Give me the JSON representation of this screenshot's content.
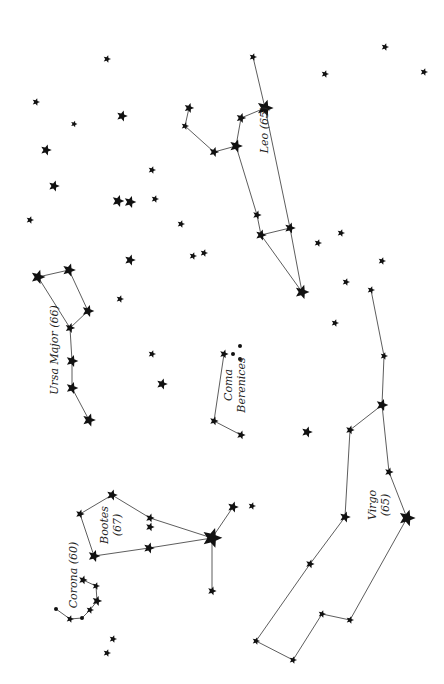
{
  "colors": {
    "background": "#ffffff",
    "ink": "#111111",
    "line": "#333333"
  },
  "constellations": [
    {
      "name": "Leo",
      "label": "Leo (65)",
      "label_pos": [
        268,
        130
      ],
      "label_rotate": -90,
      "stars": [
        [
          253,
          57,
          3.5
        ],
        [
          265,
          108,
          7.5
        ],
        [
          241,
          118,
          4.5
        ],
        [
          189,
          108,
          4.5
        ],
        [
          185,
          126,
          3.5
        ],
        [
          214,
          152,
          4.5
        ],
        [
          236,
          146,
          6
        ],
        [
          257,
          215,
          4
        ],
        [
          261,
          235,
          5
        ],
        [
          290,
          228,
          5
        ],
        [
          302,
          292,
          6.5
        ]
      ],
      "lines": [
        [
          0,
          1
        ],
        [
          1,
          2
        ],
        [
          2,
          6
        ],
        [
          3,
          4
        ],
        [
          4,
          5
        ],
        [
          5,
          6
        ],
        [
          6,
          7
        ],
        [
          7,
          8
        ],
        [
          8,
          9
        ],
        [
          1,
          9
        ],
        [
          9,
          10
        ],
        [
          8,
          10
        ]
      ]
    },
    {
      "name": "Ursa Major",
      "label": "Ursa Major (66)",
      "label_pos": [
        58,
        350
      ],
      "label_rotate": -90,
      "stars": [
        [
          38,
          277,
          6.5
        ],
        [
          69,
          270,
          6
        ],
        [
          88,
          311,
          5.5
        ],
        [
          70,
          328,
          4.5
        ],
        [
          72,
          361,
          5.5
        ],
        [
          72,
          388,
          5.5
        ],
        [
          89,
          420,
          6
        ]
      ],
      "lines": [
        [
          0,
          1
        ],
        [
          1,
          2
        ],
        [
          2,
          3
        ],
        [
          0,
          3
        ],
        [
          3,
          4
        ],
        [
          4,
          5
        ],
        [
          5,
          6
        ]
      ]
    },
    {
      "name": "Coma Berenices",
      "label": "Coma",
      "label2": "Berenices",
      "label_pos": [
        232,
        385
      ],
      "label_rotate": -90,
      "stars": [
        [
          224,
          354,
          4
        ],
        [
          214,
          421,
          4
        ],
        [
          241,
          435,
          4
        ]
      ],
      "dots": [
        [
          233,
          354,
          2
        ],
        [
          240,
          346,
          2
        ],
        [
          240,
          359,
          2
        ]
      ],
      "lines": [
        [
          0,
          1
        ],
        [
          1,
          2
        ]
      ]
    },
    {
      "name": "Virgo",
      "label": "Virgo",
      "label2": "(65)",
      "label_pos": [
        376,
        505
      ],
      "label_rotate": -90,
      "stars": [
        [
          371,
          290,
          3.5
        ],
        [
          384,
          356,
          3.5
        ],
        [
          382,
          405,
          5.5
        ],
        [
          350,
          430,
          4
        ],
        [
          389,
          472,
          4
        ],
        [
          407,
          518,
          7.5
        ],
        [
          345,
          517,
          5
        ],
        [
          310,
          564,
          4
        ],
        [
          256,
          641,
          3.5
        ],
        [
          293,
          660,
          3.5
        ],
        [
          322,
          614,
          3.5
        ],
        [
          350,
          620,
          3.5
        ]
      ],
      "lines": [
        [
          0,
          1
        ],
        [
          1,
          2
        ],
        [
          2,
          3
        ],
        [
          2,
          4
        ],
        [
          4,
          5
        ],
        [
          3,
          6
        ],
        [
          6,
          7
        ],
        [
          7,
          8
        ],
        [
          8,
          9
        ],
        [
          9,
          10
        ],
        [
          10,
          11
        ],
        [
          11,
          5
        ]
      ]
    },
    {
      "name": "Bootes",
      "label": "Bootes",
      "label2": "(67)",
      "label_pos": [
        108,
        525
      ],
      "label_rotate": -90,
      "stars": [
        [
          112,
          495,
          5
        ],
        [
          80,
          514,
          4
        ],
        [
          150,
          518,
          4
        ],
        [
          150,
          527,
          4
        ],
        [
          212,
          538,
          9
        ],
        [
          149,
          548,
          5
        ],
        [
          94,
          556,
          5.5
        ],
        [
          233,
          507,
          5
        ],
        [
          212,
          591,
          4
        ]
      ],
      "lines": [
        [
          0,
          1
        ],
        [
          1,
          6
        ],
        [
          6,
          5
        ],
        [
          5,
          4
        ],
        [
          0,
          2
        ],
        [
          2,
          4
        ],
        [
          4,
          7
        ],
        [
          4,
          8
        ]
      ]
    },
    {
      "name": "Corona",
      "label": "Corona (60)",
      "label_pos": [
        77,
        575
      ],
      "label_rotate": -90,
      "stars": [
        [
          83,
          580,
          4
        ],
        [
          96,
          586,
          3.5
        ],
        [
          97,
          601,
          4.5
        ],
        [
          90,
          610,
          3.5
        ],
        [
          70,
          619,
          3.5
        ]
      ],
      "dots": [
        [
          56,
          609,
          2
        ],
        [
          82,
          618,
          2
        ]
      ],
      "path": [
        [
          56,
          609
        ],
        [
          70,
          619
        ],
        [
          82,
          618
        ],
        [
          90,
          610
        ],
        [
          97,
          601
        ],
        [
          96,
          586
        ],
        [
          83,
          580
        ]
      ]
    }
  ],
  "field_stars": [
    [
      107,
      59,
      3.5
    ],
    [
      36,
      102,
      3.5
    ],
    [
      74,
      124,
      3
    ],
    [
      122,
      116,
      5
    ],
    [
      46,
      150,
      5
    ],
    [
      54,
      186,
      5
    ],
    [
      30,
      220,
      3.5
    ],
    [
      118,
      201,
      5.5
    ],
    [
      130,
      202,
      5.5
    ],
    [
      155,
      199,
      3.5
    ],
    [
      152,
      170,
      3.5
    ],
    [
      181,
      224,
      3.5
    ],
    [
      193,
      256,
      3.5
    ],
    [
      204,
      253,
      3.5
    ],
    [
      130,
      260,
      5
    ],
    [
      120,
      299,
      3.5
    ],
    [
      152,
      354,
      3.5
    ],
    [
      162,
      384,
      5
    ],
    [
      385,
      47,
      3.5
    ],
    [
      325,
      74,
      3.5
    ],
    [
      424,
      72,
      3.5
    ],
    [
      341,
      233,
      3.5
    ],
    [
      318,
      243,
      3.5
    ],
    [
      382,
      261,
      3.5
    ],
    [
      346,
      282,
      3.5
    ],
    [
      335,
      323,
      3.5
    ],
    [
      307,
      432,
      5
    ],
    [
      252,
      506,
      3.5
    ],
    [
      113,
      639,
      3.5
    ],
    [
      107,
      653,
      3.5
    ]
  ]
}
